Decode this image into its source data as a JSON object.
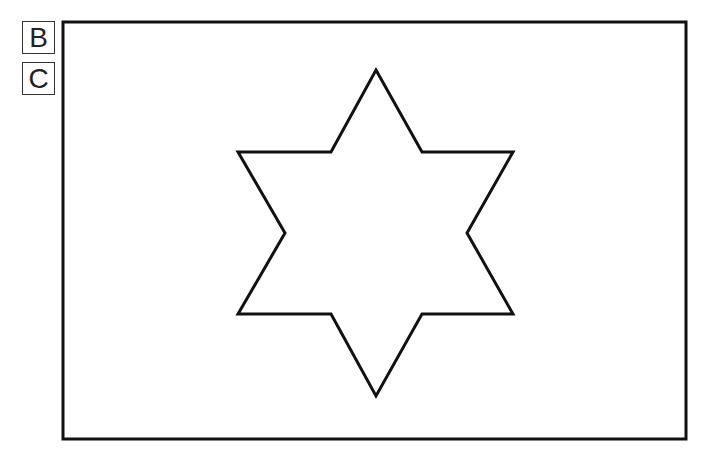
{
  "labels": [
    {
      "id": "B",
      "text": "B"
    },
    {
      "id": "C",
      "text": "C"
    }
  ],
  "frame": {
    "x": 63,
    "y": 22,
    "width": 623,
    "height": 417,
    "stroke": "#111111",
    "stroke_width": 3
  },
  "star": {
    "shape": "six-pointed-star",
    "stroke": "#111111",
    "stroke_width": 3,
    "fill": "#ffffff",
    "points": "376,70 422,152 513,152 467,233 513,314 422,314 376,396 331,314 238,314 285,233 238,152 331,152"
  }
}
